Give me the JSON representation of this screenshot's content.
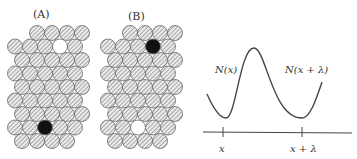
{
  "panels": {
    "a": {
      "label": "(A)"
    },
    "b": {
      "label": "(B)"
    }
  },
  "legend_items": [
    "hatched atom",
    "vacancy (white)",
    "impurity (black)"
  ],
  "curve": {
    "label_left": "N(x)",
    "label_right": "N(x + λ)"
  },
  "axis": {
    "tick_left": "x",
    "tick_right": "x + λ"
  },
  "colors": {
    "stroke": "#555555",
    "atom_fill": "#dddddd",
    "impurity": "#111111",
    "vacancy": "#ffffff"
  }
}
